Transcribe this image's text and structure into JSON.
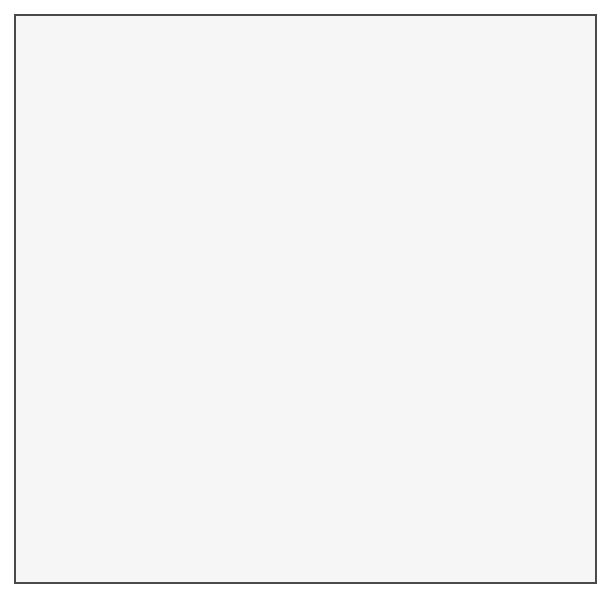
{
  "artwork": {
    "title": "Recursive Islamic Girih Tiling — Quarter Disk",
    "kind": "geometric-pattern",
    "description": "Self-similar star-and-polygon strapwork of 10-fold girih type, recursively subdivided, clipped by a large circular arc running from the upper-right to the lower-left."
  },
  "canvas": {
    "width": 613,
    "height": 608,
    "background": "#ffffff"
  },
  "frame": {
    "x": 14,
    "y": 14,
    "width": 583,
    "height": 570,
    "border_color": "#4a4a4a",
    "border_width": 2,
    "fill": "#f6f6f6"
  },
  "palette": {
    "paper": "#f6f6f6",
    "outside_arc": "#f4f4f4",
    "level1_stroke": "#1a1a1a",
    "level2_stroke": "#6e6e6e",
    "level3_stroke": "#8d8d8d",
    "level4_stroke": "#a2a2a2",
    "shade_near_arc": "#9a9a9a"
  },
  "boundary_arc": {
    "shape": "circle",
    "center_x": -62,
    "center_y": -104,
    "radius": 700,
    "note": "region inside the circle carries the pattern; outside is blank paper"
  },
  "pattern": {
    "symmetry": "10-fold girih",
    "levels": 4,
    "base_cell": 96,
    "level_scales": [
      1,
      0.382,
      0.1459,
      0.0557
    ],
    "stroke_widths": [
      2.0,
      0.85,
      0.45,
      0.3
    ],
    "density_gradient": "increases toward the circular boundary (lower-right)"
  },
  "chart_data": {
    "type": "scatter",
    "xlabel": "",
    "ylabel": "",
    "categories": [
      "level 1",
      "level 2",
      "level 3",
      "level 4"
    ],
    "values": [
      1,
      11,
      121,
      1331
    ],
    "series": [
      {
        "name": "stroke weight",
        "values": [
          2.0,
          0.85,
          0.45,
          0.3
        ]
      },
      {
        "name": "scale factor",
        "values": [
          1,
          0.382,
          0.146,
          0.056
        ]
      }
    ]
  }
}
